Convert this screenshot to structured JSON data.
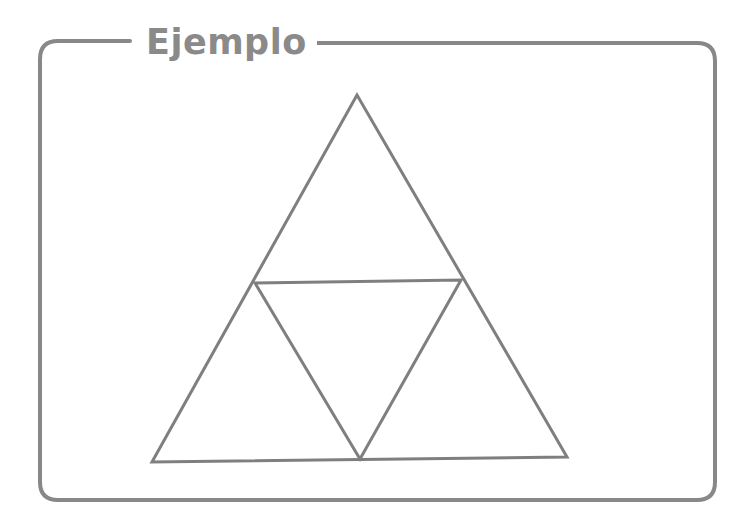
{
  "panel": {
    "title": "Ejemplo",
    "border_color": "#888888",
    "title_color": "#8a8a8a"
  },
  "diagram": {
    "stroke_color": "#7f7f7f",
    "outer_triangle": {
      "apex": [
        357,
        95
      ],
      "bottom_left": [
        152,
        462
      ],
      "bottom_right": [
        567,
        457
      ]
    },
    "inner_triangle": {
      "left_mid": [
        255,
        283
      ],
      "right_mid": [
        461,
        280
      ],
      "bottom_mid": [
        360,
        459
      ]
    }
  }
}
